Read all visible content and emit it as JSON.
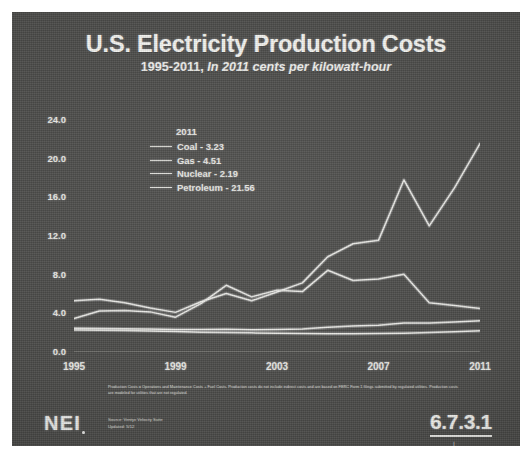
{
  "slide": {
    "title": "U.S. Electricity Production Costs",
    "subtitle_prefix": "1995-2011, ",
    "subtitle_italic": "In 2011 cents per kilowatt-hour",
    "logo": "NEI",
    "slide_number": "6.7.3.1",
    "slide_mark": "⊥",
    "footnote": "Production Costs = Operations and Maintenance Costs + Fuel Costs. Production costs do not include indirect costs and are based on FERC Form 1 filings submitted by regulated utilities. Production costs are modeled for utilities that are not regulated.",
    "source_line1": "Source: Ventyx Velocity Suite",
    "source_line2": "Updated: 5/12",
    "background_color": "#4a4a48",
    "line_color": "#e8e8e4"
  },
  "legend": {
    "title": "2011",
    "entries": [
      {
        "label": "Coal - 3.23"
      },
      {
        "label": "Gas - 4.51"
      },
      {
        "label": "Nuclear - 2.19"
      },
      {
        "label": "Petroleum - 21.56"
      }
    ]
  },
  "chart_data": {
    "type": "line",
    "title": "U.S. Electricity Production Costs",
    "subtitle": "1995-2011, In 2011 cents per kilowatt-hour",
    "xlabel": "",
    "ylabel": "",
    "x": [
      1995,
      1996,
      1997,
      1998,
      1999,
      2000,
      2001,
      2002,
      2003,
      2004,
      2005,
      2006,
      2007,
      2008,
      2009,
      2010,
      2011
    ],
    "xticks": [
      "1995",
      "1999",
      "2003",
      "2007",
      "2011"
    ],
    "xtick_values": [
      1995,
      1999,
      2003,
      2007,
      2011
    ],
    "yticks": [
      "0.0",
      "4.0",
      "8.0",
      "12.0",
      "16.0",
      "20.0",
      "24.0"
    ],
    "ytick_values": [
      0.0,
      4.0,
      8.0,
      12.0,
      16.0,
      20.0,
      24.0
    ],
    "ylim": [
      0,
      24
    ],
    "xlim": [
      1995,
      2011
    ],
    "grid": false,
    "legend_position": "upper-left-inside",
    "series": [
      {
        "name": "Petroleum",
        "label_2011": "Petroleum - 21.56",
        "values": [
          5.3,
          5.45,
          5.1,
          4.55,
          4.1,
          5.2,
          6.05,
          5.3,
          6.2,
          7.15,
          9.85,
          11.2,
          11.55,
          17.8,
          13.05,
          17.0,
          21.56
        ]
      },
      {
        "name": "Gas",
        "label_2011": "Gas - 4.51",
        "values": [
          3.45,
          4.25,
          4.3,
          4.15,
          3.6,
          5.0,
          6.9,
          5.7,
          6.4,
          6.25,
          8.45,
          7.4,
          7.55,
          8.05,
          5.1,
          4.8,
          4.51
        ]
      },
      {
        "name": "Coal",
        "label_2011": "Coal - 3.23",
        "values": [
          2.45,
          2.42,
          2.4,
          2.37,
          2.34,
          2.32,
          2.36,
          2.3,
          2.34,
          2.38,
          2.55,
          2.68,
          2.78,
          3.0,
          3.0,
          3.1,
          3.23
        ]
      },
      {
        "name": "Nuclear",
        "label_2011": "Nuclear - 2.19",
        "values": [
          2.28,
          2.25,
          2.22,
          2.18,
          2.12,
          2.05,
          2.02,
          1.98,
          1.95,
          1.92,
          1.9,
          1.9,
          1.92,
          1.95,
          2.02,
          2.1,
          2.19
        ]
      }
    ]
  }
}
